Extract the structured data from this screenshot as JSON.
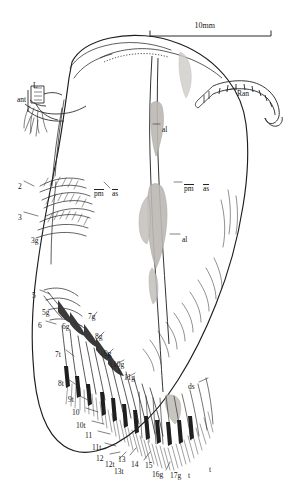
{
  "figure": {
    "caption_present": false,
    "organism_view": "lateral-view-carapace-with-thoracopods",
    "background_color": "#ffffff",
    "ink_color": "#1a1a1a",
    "shading_color": "#b9b6b1"
  },
  "scale_bar": {
    "label": "10mm",
    "x1": 150,
    "x2": 271,
    "y": 36,
    "tick_height": 6
  },
  "labels": [
    {
      "id": "L",
      "text": "L",
      "x": 33,
      "y": 82,
      "anchor": "start"
    },
    {
      "id": "ant",
      "text": "ant",
      "x": 17,
      "y": 96,
      "anchor": "start"
    },
    {
      "id": "Ran",
      "text": "Ran",
      "x": 237,
      "y": 90,
      "anchor": "start"
    },
    {
      "id": "al1",
      "text": "al",
      "x": 162,
      "y": 126,
      "anchor": "start"
    },
    {
      "id": "al2",
      "text": "al",
      "x": 182,
      "y": 236,
      "anchor": "start"
    },
    {
      "id": "pm1",
      "text": "pm",
      "x": 94,
      "y": 189,
      "anchor": "start",
      "overline": true
    },
    {
      "id": "as1",
      "text": "as",
      "x": 112,
      "y": 189,
      "anchor": "start",
      "overline": true
    },
    {
      "id": "pm2",
      "text": "pm",
      "x": 184,
      "y": 184,
      "anchor": "start",
      "overline": true
    },
    {
      "id": "as2",
      "text": "as",
      "x": 203,
      "y": 184,
      "anchor": "start",
      "overline": true
    },
    {
      "id": "n2",
      "text": "2",
      "x": 18,
      "y": 183,
      "anchor": "start"
    },
    {
      "id": "n3",
      "text": "3",
      "x": 18,
      "y": 214,
      "anchor": "start"
    },
    {
      "id": "n3g",
      "text": "3g",
      "x": 31,
      "y": 237,
      "anchor": "start"
    },
    {
      "id": "n5",
      "text": "5",
      "x": 32,
      "y": 292,
      "anchor": "start"
    },
    {
      "id": "n5g",
      "text": "5g",
      "x": 42,
      "y": 309,
      "anchor": "start"
    },
    {
      "id": "n6",
      "text": "6",
      "x": 38,
      "y": 322,
      "anchor": "start"
    },
    {
      "id": "n6g",
      "text": "6g",
      "x": 62,
      "y": 323,
      "anchor": "start"
    },
    {
      "id": "n7g",
      "text": "7g",
      "x": 88,
      "y": 313,
      "anchor": "start"
    },
    {
      "id": "n8g",
      "text": "8g",
      "x": 95,
      "y": 333,
      "anchor": "start"
    },
    {
      "id": "n7t",
      "text": "7t",
      "x": 55,
      "y": 351,
      "anchor": "start"
    },
    {
      "id": "n9g",
      "text": "9g",
      "x": 104,
      "y": 350,
      "anchor": "start"
    },
    {
      "id": "n10g",
      "text": "10g",
      "x": 113,
      "y": 361,
      "anchor": "start"
    },
    {
      "id": "n11g",
      "text": "11g",
      "x": 124,
      "y": 374,
      "anchor": "start"
    },
    {
      "id": "n8t",
      "text": "8t",
      "x": 58,
      "y": 380,
      "anchor": "start"
    },
    {
      "id": "ds",
      "text": "ds",
      "x": 188,
      "y": 383,
      "anchor": "start"
    },
    {
      "id": "n9t",
      "text": "9t",
      "x": 68,
      "y": 396,
      "anchor": "start"
    },
    {
      "id": "n10",
      "text": "10",
      "x": 72,
      "y": 409,
      "anchor": "start"
    },
    {
      "id": "n10t",
      "text": "10t",
      "x": 76,
      "y": 422,
      "anchor": "start"
    },
    {
      "id": "n11",
      "text": "11",
      "x": 85,
      "y": 432,
      "anchor": "start"
    },
    {
      "id": "n11t",
      "text": "11t",
      "x": 92,
      "y": 444,
      "anchor": "start"
    },
    {
      "id": "n12",
      "text": "12",
      "x": 96,
      "y": 455,
      "anchor": "start"
    },
    {
      "id": "n12t",
      "text": "12t",
      "x": 105,
      "y": 461,
      "anchor": "start"
    },
    {
      "id": "n13",
      "text": "13",
      "x": 118,
      "y": 456,
      "anchor": "start"
    },
    {
      "id": "n13t",
      "text": "13t",
      "x": 114,
      "y": 468,
      "anchor": "start"
    },
    {
      "id": "n14",
      "text": "14",
      "x": 131,
      "y": 461,
      "anchor": "start"
    },
    {
      "id": "n15",
      "text": "15",
      "x": 145,
      "y": 462,
      "anchor": "start"
    },
    {
      "id": "n16g",
      "text": "16g",
      "x": 152,
      "y": 471,
      "anchor": "start"
    },
    {
      "id": "n17g",
      "text": "17g",
      "x": 170,
      "y": 472,
      "anchor": "start"
    },
    {
      "id": "t1",
      "text": "t",
      "x": 188,
      "y": 472,
      "anchor": "start"
    },
    {
      "id": "t2",
      "text": "t",
      "x": 209,
      "y": 466,
      "anchor": "start"
    }
  ]
}
